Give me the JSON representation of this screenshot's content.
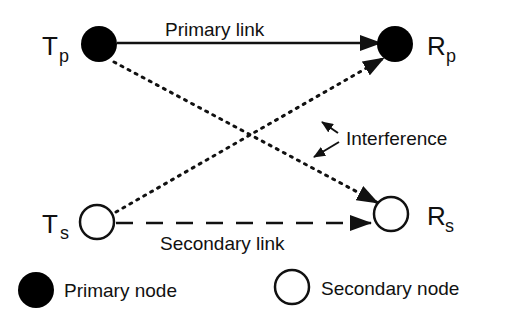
{
  "diagram": {
    "colors": {
      "stroke": "#111111",
      "primary_fill": "#000000",
      "secondary_fill": "#ffffff",
      "background": "#ffffff"
    },
    "nodes": [
      {
        "id": "Tp",
        "label_main": "T",
        "label_sub": "p",
        "type": "primary"
      },
      {
        "id": "Rp",
        "label_main": "R",
        "label_sub": "p",
        "type": "primary"
      },
      {
        "id": "Ts",
        "label_main": "T",
        "label_sub": "s",
        "type": "secondary"
      },
      {
        "id": "Rs",
        "label_main": "R",
        "label_sub": "s",
        "type": "secondary"
      }
    ],
    "links": {
      "primary": {
        "label": "Primary link",
        "from": "Tp",
        "to": "Rp",
        "style": "solid"
      },
      "secondary": {
        "label": "Secondary link",
        "from": "Ts",
        "to": "Rs",
        "style": "dashed"
      },
      "interference": {
        "label": "Interference",
        "style": "dotted",
        "paths": [
          {
            "from": "Tp",
            "to": "Rs"
          },
          {
            "from": "Ts",
            "to": "Rp"
          }
        ]
      }
    },
    "legend": [
      {
        "label": "Primary node",
        "type": "primary"
      },
      {
        "label": "Secondary node",
        "type": "secondary"
      }
    ]
  }
}
